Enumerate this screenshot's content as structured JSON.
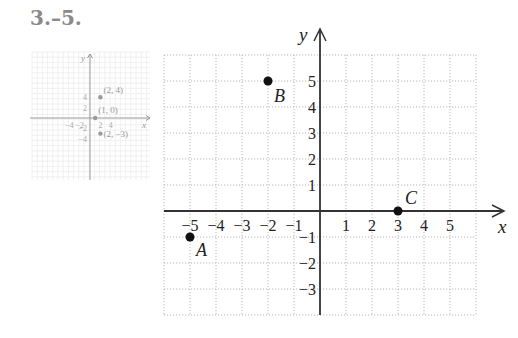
{
  "problem_label": "3.–5.",
  "chart_data": [
    {
      "type": "scatter",
      "name": "answer-inset",
      "title": "",
      "xlabel": "x",
      "ylabel": "y",
      "xlim": [
        -6,
        6
      ],
      "ylim": [
        -6,
        6
      ],
      "grid": true,
      "x_ticks": [
        -4,
        -2,
        2,
        4
      ],
      "x_tick_labels": [
        "−4",
        "−2",
        "2",
        "4"
      ],
      "y_ticks": [
        4,
        2,
        -2,
        -4
      ],
      "y_tick_labels": [
        "4",
        "2",
        "−2",
        "−4"
      ],
      "points": [
        {
          "x": 2,
          "y": 4,
          "label": "(2, 4)"
        },
        {
          "x": 1,
          "y": 0,
          "label": "(1, 0)"
        },
        {
          "x": 2,
          "y": -3,
          "label": "(2, −3)"
        }
      ],
      "color": "#9a9a9a"
    },
    {
      "type": "scatter",
      "name": "main-graph",
      "title": "",
      "xlabel": "x",
      "ylabel": "y",
      "xlim": [
        -6,
        6
      ],
      "ylim": [
        -4,
        6
      ],
      "grid": true,
      "x_ticks": [
        -5,
        -4,
        -3,
        -2,
        -1,
        1,
        2,
        3,
        4,
        5
      ],
      "x_tick_labels": [
        "−5",
        "−4",
        "−3",
        "−2",
        "−1",
        "1",
        "2",
        "3",
        "4",
        "5"
      ],
      "y_ticks": [
        5,
        4,
        3,
        2,
        1,
        -1,
        -2,
        -3
      ],
      "y_tick_labels": [
        "5",
        "4",
        "3",
        "2",
        "1",
        "−1",
        "−2",
        "−3"
      ],
      "points": [
        {
          "x": -5,
          "y": -1,
          "label": "A"
        },
        {
          "x": -2,
          "y": 5,
          "label": "B"
        },
        {
          "x": 3,
          "y": 0,
          "label": "C"
        }
      ],
      "color": "#111111"
    }
  ]
}
